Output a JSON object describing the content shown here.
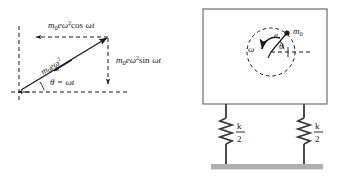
{
  "figure": {
    "colors": {
      "stroke": "#1a1a1a",
      "box_stroke": "#6e6e6e",
      "spring": "#3a3a3a",
      "ground": "#b0b0b0",
      "background": "#ffffff"
    }
  },
  "left_diagram": {
    "name": "force-vector-decomposition",
    "labels": {
      "horizontal_component": {
        "m": "m",
        "m_sub": "0",
        "e": "e",
        "omega": "ω",
        "omega_sup": "2",
        "trig": "cos",
        "arg_omega": "ω",
        "arg_t": "t",
        "full": "m₀eω² cos ωt"
      },
      "vertical_component": {
        "m": "m",
        "m_sub": "0",
        "e": "e",
        "omega": "ω",
        "omega_sup": "2",
        "trig": "sin",
        "arg_omega": "ω",
        "arg_t": "t",
        "full": "m₀eω² sin ωt"
      },
      "resultant": {
        "m": "m",
        "m_sub": "0",
        "e": "e",
        "omega": "ω",
        "omega_sup": "2",
        "full": "m₀eω²"
      },
      "angle": {
        "theta": "θ",
        "equals": "=",
        "omega": "ω",
        "t": "t",
        "full": "θ = ωt"
      }
    }
  },
  "right_diagram": {
    "name": "mass-spring-rotor-system",
    "labels": {
      "omega": "ω",
      "eccentricity": "e",
      "theta": "θ",
      "unbalance_mass": "m",
      "unbalance_mass_sub": "0",
      "spring_left_numerator": "k",
      "spring_left_denominator": "2",
      "spring_right_numerator": "k",
      "spring_right_denominator": "2"
    }
  }
}
